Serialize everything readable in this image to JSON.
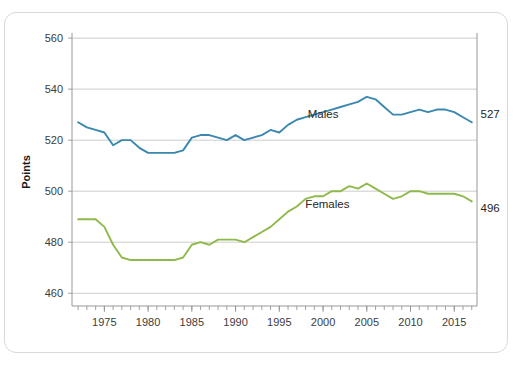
{
  "chart_data": {
    "type": "line",
    "title": "",
    "xlabel": "",
    "ylabel": "Points",
    "ylim": [
      455,
      562
    ],
    "xlim": [
      1971.3,
      2017.6
    ],
    "grid": true,
    "y_ticks": [
      460,
      480,
      500,
      520,
      540,
      560
    ],
    "x_ticks": [
      1975,
      1980,
      1985,
      1990,
      1995,
      2000,
      2005,
      2010,
      2015
    ],
    "x_minor_step": 1,
    "legend_position": "inline-labels",
    "annotations": [
      {
        "text": "Males",
        "x": 2000,
        "y": 528.5
      },
      {
        "text": "Females",
        "x": 2000.5,
        "y": 493.5
      },
      {
        "text": "527",
        "x": 2018.0,
        "y": 528.5
      },
      {
        "text": "496",
        "x": 2018.0,
        "y": 492.0
      }
    ],
    "series": [
      {
        "name": "Males",
        "color": "#3a87b0",
        "end_value_label": "527",
        "x": [
          1972,
          1973,
          1974,
          1975,
          1976,
          1977,
          1978,
          1979,
          1980,
          1981,
          1982,
          1983,
          1984,
          1985,
          1986,
          1987,
          1988,
          1989,
          1990,
          1991,
          1992,
          1993,
          1994,
          1995,
          1996,
          1997,
          1998,
          1999,
          2000,
          2001,
          2002,
          2003,
          2004,
          2005,
          2006,
          2007,
          2008,
          2009,
          2010,
          2011,
          2012,
          2013,
          2014,
          2015,
          2016,
          2017
        ],
        "values": [
          527,
          525,
          524,
          523,
          518,
          520,
          520,
          517,
          515,
          515,
          515,
          515,
          516,
          521,
          522,
          522,
          521,
          520,
          522,
          520,
          521,
          522,
          524,
          523,
          526,
          528,
          529,
          530,
          531,
          532,
          533,
          534,
          535,
          537,
          536,
          533,
          530,
          530,
          531,
          532,
          531,
          532,
          532,
          531,
          529,
          527
        ]
      },
      {
        "name": "Females",
        "color": "#8fb94a",
        "end_value_label": "496",
        "x": [
          1972,
          1973,
          1974,
          1975,
          1976,
          1977,
          1978,
          1979,
          1980,
          1981,
          1982,
          1983,
          1984,
          1985,
          1986,
          1987,
          1988,
          1989,
          1990,
          1991,
          1992,
          1993,
          1994,
          1995,
          1996,
          1997,
          1998,
          1999,
          2000,
          2001,
          2002,
          2003,
          2004,
          2005,
          2006,
          2007,
          2008,
          2009,
          2010,
          2011,
          2012,
          2013,
          2014,
          2015,
          2016,
          2017
        ],
        "values": [
          489,
          489,
          489,
          486,
          479,
          474,
          473,
          473,
          473,
          473,
          473,
          473,
          474,
          479,
          480,
          479,
          481,
          481,
          481,
          480,
          482,
          484,
          486,
          489,
          492,
          494,
          497,
          498,
          498,
          500,
          500,
          502,
          501,
          503,
          501,
          499,
          497,
          498,
          500,
          500,
          499,
          499,
          499,
          499,
          498,
          496
        ]
      }
    ]
  }
}
